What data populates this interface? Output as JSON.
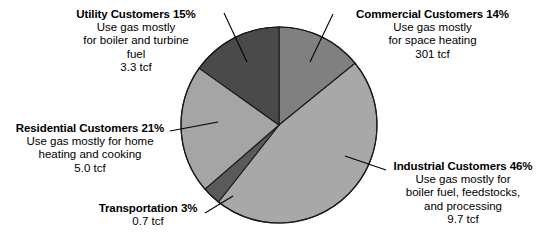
{
  "chart_data": {
    "type": "pie",
    "title": "",
    "subtitle": "",
    "xlabel": "",
    "ylabel": "",
    "legend_position": "none",
    "grid": false,
    "unit": "tcf",
    "start_angle_deg": 0,
    "direction": "clockwise",
    "categories": [
      "Commercial Customers",
      "Industrial Customers",
      "Transportation",
      "Residential Customers",
      "Utility Customers"
    ],
    "values": [
      14,
      46,
      3,
      21,
      15
    ],
    "value_labels": [
      "301 tcf",
      "9.7 tcf",
      "0.7 tcf",
      "5.0 tcf",
      "3.3 tcf"
    ],
    "colors": [
      "#808080",
      "#a8a8a8",
      "#5a5a5a",
      "#a5a5a5",
      "#4a4a4a"
    ],
    "slices": [
      {
        "name": "Commercial Customers",
        "percent": 14,
        "percent_label": "14%",
        "amount": "301 tcf",
        "color": "#808080",
        "description": "Use gas mostly for space heating"
      },
      {
        "name": "Industrial Customers",
        "percent": 46,
        "percent_label": "46%",
        "amount": "9.7 tcf",
        "color": "#a8a8a8",
        "description": "Use gas mostly for boiler fuel, feedstocks, and processing"
      },
      {
        "name": "Transportation",
        "percent": 3,
        "percent_label": "3%",
        "amount": "0.7 tcf",
        "color": "#5a5a5a",
        "description": ""
      },
      {
        "name": "Residential Customers",
        "percent": 21,
        "percent_label": "21%",
        "amount": "5.0 tcf",
        "color": "#a5a5a5",
        "description": "Use gas mostly for home heating and cooking"
      },
      {
        "name": "Utility Customers",
        "percent": 15,
        "percent_label": "15%",
        "amount": "3.3 tcf",
        "color": "#4a4a4a",
        "description": "Use gas mostly for boiler and turbine fuel"
      }
    ]
  },
  "labels": {
    "utility": {
      "heading": "Utility Customers 15%",
      "line1": "Use gas mostly",
      "line2": "for boiler and turbine",
      "line3": "fuel",
      "line4": "3.3 tcf"
    },
    "commercial": {
      "heading": "Commercial Customers 14%",
      "line1": "Use gas mostly",
      "line2": "for space heating",
      "line3": "301 tcf"
    },
    "residential": {
      "heading": "Residential Customers 21%",
      "line1": "Use gas mostly for home",
      "line2": "heating and cooking",
      "line3": "5.0 tcf"
    },
    "industrial": {
      "heading": "Industrial Customers 46%",
      "line1": "Use gas mostly for",
      "line2": "boiler fuel, feedstocks,",
      "line3": "and processing",
      "line4": "9.7 tcf"
    },
    "transportation": {
      "heading": "Transportation 3%",
      "line1": "0.7 tcf"
    }
  }
}
